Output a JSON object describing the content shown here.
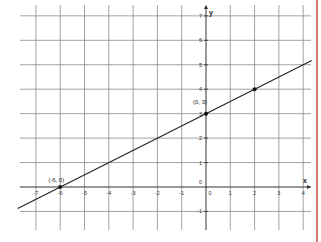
{
  "chart_data": {
    "type": "line",
    "title": "",
    "xlabel": "x",
    "ylabel": "y",
    "xlim": [
      -7.75,
      4.35
    ],
    "ylim": [
      -1.75,
      7.3
    ],
    "grid": true,
    "x_ticks": [
      -7,
      -6,
      -5,
      -4,
      -3,
      -2,
      -1,
      0,
      1,
      2,
      3,
      4
    ],
    "y_ticks": [
      -1,
      0,
      1,
      2,
      3,
      4,
      5,
      6,
      7
    ],
    "series": [
      {
        "name": "y = x/2 + 3",
        "equation": "y = 0.5x + 3",
        "slope": 0.5,
        "intercept": 3,
        "x": [
          -7.75,
          4.35
        ],
        "y": [
          -0.875,
          5.175
        ],
        "color": "#222222"
      }
    ],
    "points": [
      {
        "x": -6,
        "y": 0,
        "label": "(-6, 0)"
      },
      {
        "x": 0,
        "y": 3,
        "label": "(0, 3)"
      },
      {
        "x": 2,
        "y": 4,
        "label": ""
      }
    ],
    "legend": null
  },
  "labels": {
    "x_axis": "x",
    "y_axis": "y",
    "origin_y_label": "0",
    "origin_x_label": "0"
  },
  "colors": {
    "grid": "#8a8a8a",
    "axis": "#333333",
    "line": "#222222",
    "point": "#111111",
    "border": "#d27a6e"
  }
}
